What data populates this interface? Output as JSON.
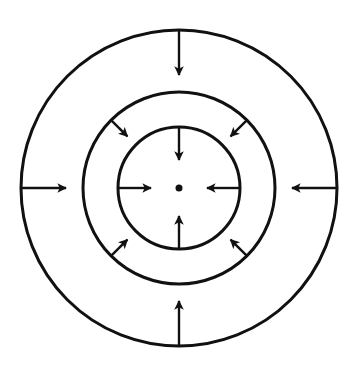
{
  "diagram": {
    "title": "",
    "colors": {
      "stroke": "#111111",
      "background": "#ffffff"
    },
    "center": {
      "x": 179,
      "y": 188
    },
    "circles": [
      {
        "name": "outer-circle",
        "r": 158
      },
      {
        "name": "middle-circle",
        "r": 96
      },
      {
        "name": "inner-circle",
        "r": 61
      }
    ],
    "center_dot": {
      "r": 3.5
    },
    "arrow_groups": [
      {
        "name": "outer-ring-arrows",
        "from_r": 158,
        "to_r": 113,
        "angles_deg": [
          270,
          90,
          180,
          0
        ]
      },
      {
        "name": "middle-ring-arrows",
        "from_r": 96,
        "to_r": 73,
        "angles_deg": [
          225,
          315,
          135,
          45
        ]
      },
      {
        "name": "inner-circle-arrows",
        "from_r": 60,
        "to_r": 28,
        "angles_deg": [
          270,
          90,
          180,
          0
        ]
      }
    ]
  }
}
